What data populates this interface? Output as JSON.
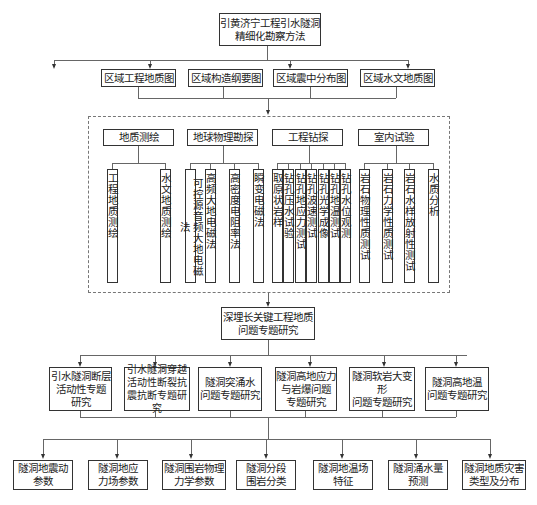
{
  "root": {
    "line1": "引黄济宁工程引水隧洞",
    "line2": "精细化勘察方法"
  },
  "regional_maps": [
    {
      "label": "区域工程地质图"
    },
    {
      "label": "区域构造纲要图"
    },
    {
      "label": "区域震中分布图"
    },
    {
      "label": "区域水文地质图"
    }
  ],
  "methods": [
    {
      "label": "地质测绘",
      "children": [
        "工程地质测绘",
        "水文地质测绘"
      ]
    },
    {
      "label": "地球物理勘探",
      "children": [
        "可控源音频大地电磁法",
        "高频大地电磁法",
        "高密度电阻率法",
        "瞬变电磁法"
      ]
    },
    {
      "label": "工程钻探",
      "children": [
        "取原状岩样",
        "钻孔压水试验",
        "钻孔地应力测试",
        "钻孔波速测试",
        "钻孔光学成像",
        "钻孔地温测试",
        "钻孔水位观测"
      ]
    },
    {
      "label": "室内试验",
      "children": [
        "岩石物理性质测试",
        "岩石力学性质测试",
        "岩石水样放射性测试",
        "水质分析"
      ]
    }
  ],
  "research": {
    "line1": "深埋长关键工程地质",
    "line2": "问题专题研究"
  },
  "topics": [
    {
      "lines": [
        "引水隧洞断层",
        "活动性专题",
        "研究"
      ]
    },
    {
      "lines": [
        "引水隧洞穿越",
        "活动性断裂抗",
        "震抗断专题研究"
      ]
    },
    {
      "lines": [
        "隧洞突涌水",
        "问题专题研究"
      ]
    },
    {
      "lines": [
        "隧洞高地应力",
        "与岩爆问题",
        "专题研究"
      ]
    },
    {
      "lines": [
        "隧洞软岩大变形",
        "问题专题研究"
      ]
    },
    {
      "lines": [
        "隧洞高地温",
        "问题专题研究"
      ]
    }
  ],
  "outputs": [
    {
      "lines": [
        "隧洞地震动",
        "参数"
      ]
    },
    {
      "lines": [
        "隧洞地应",
        "力场参数"
      ]
    },
    {
      "lines": [
        "隧洞围岩物理",
        "力学参数"
      ]
    },
    {
      "lines": [
        "隧洞分段",
        "围岩分类"
      ]
    },
    {
      "lines": [
        "隧洞地温场",
        "特征"
      ]
    },
    {
      "lines": [
        "隧洞涌水量",
        "预测"
      ]
    },
    {
      "lines": [
        "隧洞地质灾害",
        "类型及分布"
      ]
    }
  ]
}
